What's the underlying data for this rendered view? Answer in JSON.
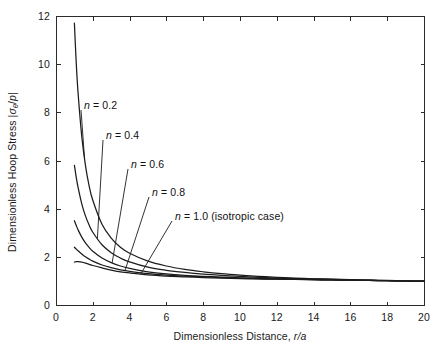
{
  "figure": {
    "background_color": "#ffffff",
    "line_color": "#1c1c1c",
    "axis_color": "#2b2b2b"
  },
  "axes": {
    "x": {
      "title": "Dimensionless Distance, r/a",
      "title_plain": "Dimensionless Distance,",
      "title_symbol": "r/a",
      "min": 0,
      "max": 20,
      "tick_values": [
        0,
        2,
        4,
        6,
        8,
        10,
        12,
        14,
        16,
        18,
        20
      ],
      "tick_labels": [
        "0",
        "2",
        "4",
        "6",
        "8",
        "10",
        "12",
        "14",
        "16",
        "18",
        "20"
      ]
    },
    "y": {
      "title": "Dimensionless Hoop Stress |σθ/p|",
      "title_plain_1": "Dimensionless Hoop Stress |",
      "title_symbol_sigma": "σ",
      "title_symbol_sub": "θ",
      "title_plain_2": "/",
      "title_symbol_p": "p",
      "title_plain_3": "|",
      "min": 0,
      "max": 12,
      "tick_values": [
        0,
        2,
        4,
        6,
        8,
        10,
        12
      ],
      "tick_labels": [
        "0",
        "2",
        "4",
        "6",
        "8",
        "10",
        "12"
      ]
    }
  },
  "curve_labels": [
    {
      "id": "n-02",
      "text_prefix": "n",
      "text_rest": " = 0.2",
      "full": "n = 0.2",
      "x_px": 84,
      "y_px": 99
    },
    {
      "id": "n-04",
      "text_prefix": "n",
      "text_rest": " = 0.4",
      "full": "n = 0.4",
      "x_px": 106,
      "y_px": 129
    },
    {
      "id": "n-06",
      "text_prefix": "n",
      "text_rest": " = 0.6",
      "full": "n = 0.6",
      "x_px": 131,
      "y_px": 158
    },
    {
      "id": "n-08",
      "text_prefix": "n",
      "text_rest": " = 0.8",
      "full": "n = 0.8",
      "x_px": 152,
      "y_px": 186
    },
    {
      "id": "n-10",
      "text_prefix": "n",
      "text_rest": " = 1.0 (isotropic case)",
      "full": "n = 1.0 (isotropic case)",
      "x_px": 175,
      "y_px": 210
    }
  ],
  "chart_data": {
    "type": "line",
    "title": "",
    "xlabel": "Dimensionless Distance, r/a",
    "ylabel": "Dimensionless Hoop Stress |σθ/p|",
    "xlim": [
      0,
      20
    ],
    "ylim": [
      0,
      12
    ],
    "xticks": [
      0,
      2,
      4,
      6,
      8,
      10,
      12,
      14,
      16,
      18,
      20
    ],
    "yticks": [
      0,
      2,
      4,
      6,
      8,
      10,
      12
    ],
    "grid": false,
    "legend": "inline-annotations",
    "legend_position": "in-plot-upper-left",
    "x": [
      1.0,
      1.1,
      1.2,
      1.4,
      1.6,
      1.8,
      2.0,
      2.5,
      3.0,
      3.5,
      4.0,
      5.0,
      6.0,
      7.0,
      8.0,
      9.0,
      10.0,
      11.0,
      12.0,
      13.0,
      14.0,
      15.0,
      16.0,
      17.0,
      18.0,
      19.0,
      20.0
    ],
    "series": [
      {
        "name": "n = 0.2",
        "n": 0.2,
        "values": [
          11.7,
          10.05,
          8.8,
          7.0,
          5.8,
          4.95,
          4.35,
          3.35,
          2.78,
          2.4,
          2.15,
          1.82,
          1.62,
          1.48,
          1.38,
          1.3,
          1.24,
          1.19,
          1.15,
          1.12,
          1.09,
          1.07,
          1.05,
          1.03,
          1.01,
          1.0,
          0.99
        ]
      },
      {
        "name": "n = 0.4",
        "n": 0.4,
        "values": [
          5.8,
          5.3,
          4.88,
          4.2,
          3.7,
          3.32,
          3.02,
          2.5,
          2.17,
          1.95,
          1.79,
          1.57,
          1.44,
          1.35,
          1.28,
          1.23,
          1.19,
          1.15,
          1.12,
          1.1,
          1.08,
          1.06,
          1.04,
          1.03,
          1.02,
          1.0,
          0.99
        ]
      },
      {
        "name": "n = 0.6",
        "n": 0.6,
        "values": [
          3.5,
          3.3,
          3.12,
          2.82,
          2.58,
          2.39,
          2.23,
          1.95,
          1.76,
          1.62,
          1.52,
          1.38,
          1.29,
          1.23,
          1.19,
          1.16,
          1.13,
          1.1,
          1.08,
          1.07,
          1.05,
          1.04,
          1.03,
          1.02,
          1.01,
          1.0,
          0.99
        ]
      },
      {
        "name": "n = 0.8",
        "n": 0.8,
        "values": [
          2.4,
          2.32,
          2.25,
          2.12,
          2.0,
          1.91,
          1.82,
          1.66,
          1.55,
          1.46,
          1.4,
          1.3,
          1.24,
          1.2,
          1.17,
          1.14,
          1.12,
          1.1,
          1.08,
          1.07,
          1.05,
          1.04,
          1.03,
          1.02,
          1.01,
          1.0,
          0.99
        ]
      },
      {
        "name": "n = 1.0 (isotropic case)",
        "n": 1.0,
        "values": [
          1.78,
          1.8,
          1.8,
          1.78,
          1.74,
          1.69,
          1.64,
          1.54,
          1.45,
          1.38,
          1.33,
          1.25,
          1.2,
          1.17,
          1.14,
          1.12,
          1.1,
          1.08,
          1.07,
          1.06,
          1.05,
          1.04,
          1.03,
          1.02,
          1.01,
          1.0,
          0.99
        ]
      }
    ],
    "annotations": [
      {
        "label": "n = 0.2",
        "points_to_series": 0
      },
      {
        "label": "n = 0.4",
        "points_to_series": 1
      },
      {
        "label": "n = 0.6",
        "points_to_series": 2
      },
      {
        "label": "n = 0.8",
        "points_to_series": 3
      },
      {
        "label": "n = 1.0 (isotropic case)",
        "points_to_series": 4
      }
    ]
  },
  "plot_geometry": {
    "left_px": 56,
    "right_px": 424,
    "top_px": 16,
    "bottom_px": 305
  }
}
